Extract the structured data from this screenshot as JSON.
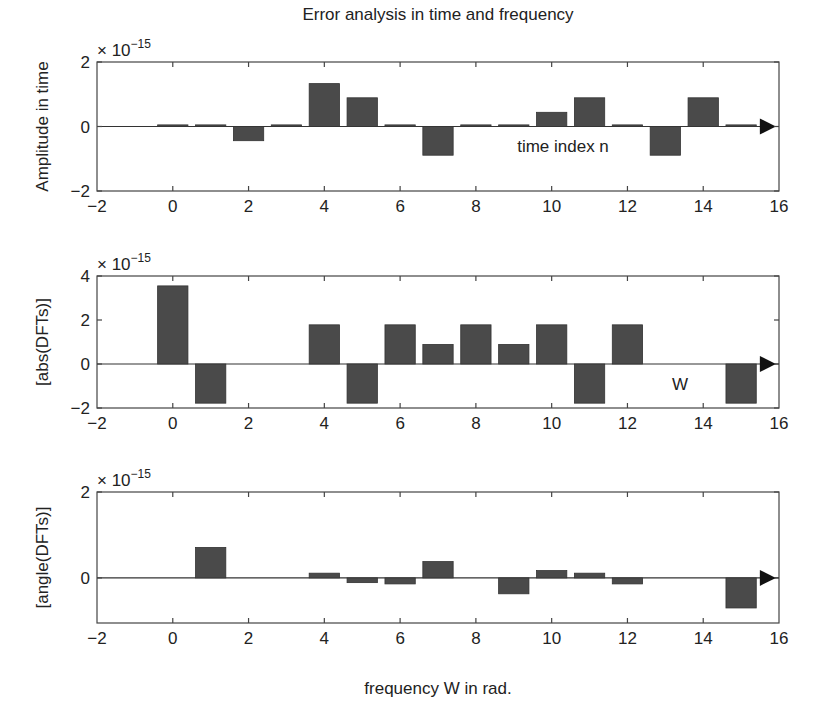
{
  "figure": {
    "title": "Error analysis in time and frequency",
    "bar_color": "#4a4a4a",
    "xlabel": "frequency W in rad."
  },
  "chart_data": [
    {
      "type": "bar",
      "panel": "top",
      "title": "Error analysis in time and frequency",
      "ylabel": "Amplitude in time",
      "xlabel": "",
      "annotation": "time index n",
      "scale_label": "× 10",
      "scale_exponent": "−15",
      "xlim": [
        -2,
        16
      ],
      "ylim": [
        -2,
        2
      ],
      "xticks": [
        "−2",
        "0",
        "2",
        "4",
        "6",
        "8",
        "10",
        "12",
        "14",
        "16"
      ],
      "yticks": [
        "2",
        "0",
        "−2"
      ],
      "x": [
        -2,
        0,
        1,
        2,
        3,
        4,
        5,
        6,
        7,
        8,
        9,
        10,
        11,
        12,
        13,
        14,
        15
      ],
      "values": [
        0.05,
        0.05,
        0.05,
        -0.44,
        0.05,
        1.33,
        0.89,
        0.05,
        -0.89,
        0.05,
        0.05,
        0.44,
        0.89,
        0.05,
        -0.89,
        0.89,
        0.05
      ],
      "units": "×1e-15"
    },
    {
      "type": "bar",
      "panel": "middle",
      "ylabel": "[abs(DFTs)]",
      "xlabel": "",
      "annotation": "W",
      "scale_label": "× 10",
      "scale_exponent": "−15",
      "xlim": [
        -2,
        16
      ],
      "ylim": [
        -2,
        4
      ],
      "xticks": [
        "−2",
        "0",
        "2",
        "4",
        "6",
        "8",
        "10",
        "12",
        "14",
        "16"
      ],
      "yticks": [
        "4",
        "2",
        "0",
        "−2"
      ],
      "x": [
        0,
        1,
        2,
        3,
        4,
        5,
        6,
        7,
        8,
        9,
        10,
        11,
        12,
        13,
        14,
        15
      ],
      "values": [
        3.55,
        -1.78,
        0,
        0,
        1.78,
        -1.78,
        1.78,
        0.89,
        1.78,
        0.89,
        1.78,
        -1.78,
        1.78,
        0,
        0,
        -1.78
      ],
      "units": "×1e-15"
    },
    {
      "type": "bar",
      "panel": "bottom",
      "ylabel": "[angle(DFTs)]",
      "xlabel": "frequency W in rad.",
      "scale_label": "× 10",
      "scale_exponent": "−15",
      "xlim": [
        -2,
        16
      ],
      "ylim": [
        -1.05,
        2
      ],
      "xticks": [
        "−2",
        "0",
        "2",
        "4",
        "6",
        "8",
        "10",
        "12",
        "14",
        "16"
      ],
      "yticks": [
        "2",
        "0"
      ],
      "x": [
        0,
        1,
        2,
        3,
        4,
        5,
        6,
        7,
        8,
        9,
        10,
        11,
        12,
        13,
        14,
        15
      ],
      "values": [
        0,
        0.71,
        0,
        0,
        0.11,
        -0.11,
        -0.14,
        0.38,
        0,
        -0.37,
        0.17,
        0.11,
        -0.14,
        0,
        0,
        -0.7
      ],
      "units": "×1e-15"
    }
  ]
}
